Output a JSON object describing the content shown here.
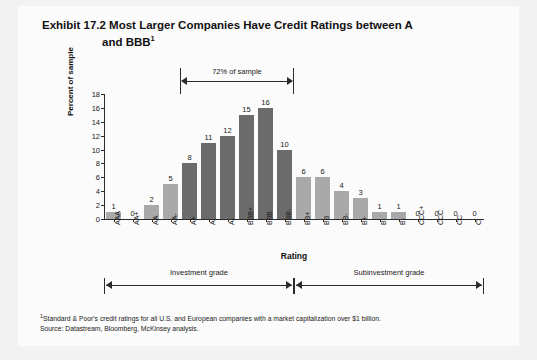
{
  "exhibit": {
    "title_line_1": "Exhibit 17.2 Most Larger Companies Have Credit Ratings between A",
    "title_line_2": "and BBB",
    "title_footnote_marker": "1"
  },
  "chart_data": {
    "type": "bar",
    "title": "Exhibit 17.2 Most Larger Companies Have Credit Ratings between A and BBB",
    "xlabel": "Rating",
    "ylabel": "Percent of sample",
    "ylim": [
      0,
      18
    ],
    "yticks": [
      0,
      2,
      4,
      6,
      8,
      10,
      12,
      14,
      16,
      18
    ],
    "grid": false,
    "legend": "none",
    "categories": [
      "AAA",
      "AA+",
      "AA",
      "AA-",
      "A+",
      "A",
      "A-",
      "BBB+",
      "BBB",
      "BBB-",
      "BB+",
      "BB",
      "BB-",
      "B+",
      "B",
      "B-",
      "CCC+",
      "CCC",
      "CC",
      "C"
    ],
    "values": [
      1,
      0,
      2,
      5,
      8,
      11,
      12,
      15,
      16,
      10,
      6,
      6,
      4,
      3,
      1,
      1,
      0,
      0,
      0,
      0
    ],
    "bar_styles": [
      "light",
      "light",
      "light",
      "light",
      "dark",
      "dark",
      "dark",
      "dark",
      "dark",
      "dark",
      "light",
      "light",
      "light",
      "light",
      "light",
      "light",
      "light",
      "light",
      "light",
      "light"
    ],
    "colors": {
      "dark_bar": "#6b6b6b",
      "light_bar": "#a9a9a9",
      "axis": "#2b2b2b",
      "text": "#1a1a1a",
      "page_background": "#fbfbfb"
    },
    "annotations": [
      {
        "id": "sample-span",
        "label": "72% of sample",
        "from_category": "A+",
        "to_category": "BBB-",
        "position": "above-bars"
      }
    ]
  },
  "grade_brackets": [
    {
      "label": "Investment grade",
      "from_category": "AAA",
      "to_category": "BBB-"
    },
    {
      "label": "Subinvestment grade",
      "from_category": "BB+",
      "to_category": "C"
    }
  ],
  "footnotes": {
    "marker": "1",
    "note": "Standard & Poor's credit ratings for all U.S. and European companies with a market capitalization over $1 billion.",
    "source": "Source: Datastream, Bloomberg, McKinsey analysis."
  }
}
